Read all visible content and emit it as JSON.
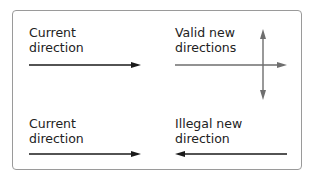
{
  "diagram": {
    "top_left": {
      "line1": "Current",
      "line2": "direction",
      "arrow": "right",
      "arrow_color": "#1a1a1a"
    },
    "top_right": {
      "line1": "Valid new",
      "line2": "directions",
      "arrows": [
        "right",
        "up",
        "down"
      ],
      "arrow_color": "#6e6e6e"
    },
    "bottom_left": {
      "line1": "Current",
      "line2": "direction",
      "arrow": "right",
      "arrow_color": "#1a1a1a"
    },
    "bottom_right": {
      "line1": "Illegal new",
      "line2": "direction",
      "arrow": "left",
      "arrow_color": "#1a1a1a"
    }
  }
}
